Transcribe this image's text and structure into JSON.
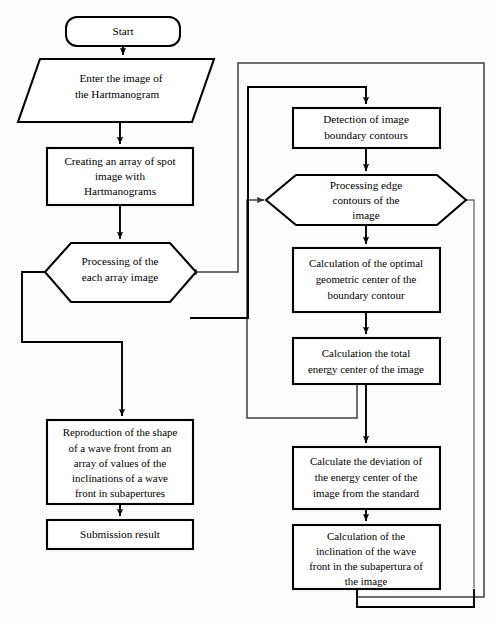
{
  "diagram": {
    "type": "flowchart",
    "orientation": "top-to-bottom, two-column",
    "colors": {
      "background": "#fdfdfd",
      "node_fill": "#ffffff",
      "node_stroke": "#000000",
      "connector": "#000000",
      "loop_line": "#3f3f3f"
    },
    "nodes": [
      {
        "id": "start",
        "shape": "terminator",
        "column": "left",
        "lines": [
          "Start"
        ]
      },
      {
        "id": "enter-image",
        "shape": "parallelogram",
        "column": "left",
        "lines": [
          "Enter the image of",
          "the Hartmanogram"
        ]
      },
      {
        "id": "creating-array",
        "shape": "process",
        "column": "left",
        "lines": [
          "Creating an array of spot",
          "image with",
          "Hartmanograms"
        ]
      },
      {
        "id": "processing-each",
        "shape": "hexagon",
        "column": "left",
        "lines": [
          "Processing of the",
          "each array image"
        ]
      },
      {
        "id": "reproduction",
        "shape": "process",
        "column": "left",
        "lines": [
          "Reproduction of the shape",
          "of a wave front from an",
          "array of values of the",
          "inclinations of a wave",
          "front in subapertures"
        ]
      },
      {
        "id": "submission",
        "shape": "process",
        "column": "left",
        "lines": [
          "Submission result"
        ]
      },
      {
        "id": "detection",
        "shape": "process",
        "column": "right",
        "lines": [
          "Detection of image",
          "boundary contours"
        ]
      },
      {
        "id": "processing-edge",
        "shape": "hexagon",
        "column": "right",
        "lines": [
          "Processing edge",
          "contours of the",
          "image"
        ]
      },
      {
        "id": "geometric-center",
        "shape": "process",
        "column": "right",
        "lines": [
          "Calculation of the optimal",
          "geometric center of the",
          "boundary contour"
        ]
      },
      {
        "id": "energy-center",
        "shape": "process",
        "column": "right",
        "lines": [
          "Calculation the total",
          "energy center of the image"
        ]
      },
      {
        "id": "deviation",
        "shape": "process",
        "column": "right",
        "lines": [
          "Calculate the deviation of",
          "the energy center of the",
          "image from the standard"
        ]
      },
      {
        "id": "inclination",
        "shape": "process",
        "column": "right",
        "lines": [
          "Calculation of the",
          "inclination of the wave",
          "front in the subapertura of",
          "the image"
        ]
      }
    ],
    "edges": [
      {
        "from": "start",
        "to": "enter-image",
        "kind": "arrow"
      },
      {
        "from": "enter-image",
        "to": "creating-array",
        "kind": "arrow"
      },
      {
        "from": "creating-array",
        "to": "processing-each",
        "kind": "arrow"
      },
      {
        "from": "processing-each",
        "to": "detection",
        "kind": "loop-right-up",
        "label": ""
      },
      {
        "from": "processing-each",
        "to": "reproduction",
        "kind": "loop-left-down"
      },
      {
        "from": "reproduction",
        "to": "submission",
        "kind": "arrow"
      },
      {
        "from": "detection",
        "to": "processing-edge",
        "kind": "arrow"
      },
      {
        "from": "processing-edge",
        "to": "geometric-center",
        "kind": "arrow"
      },
      {
        "from": "geometric-center",
        "to": "energy-center",
        "kind": "arrow"
      },
      {
        "from": "energy-center",
        "to": "processing-edge",
        "kind": "loop-left-up"
      },
      {
        "from": "energy-center",
        "to": "deviation",
        "kind": "arrow"
      },
      {
        "from": "deviation",
        "to": "inclination",
        "kind": "arrow"
      },
      {
        "from": "inclination",
        "to": "processing-each",
        "kind": "loop-outer-right-up"
      }
    ]
  }
}
